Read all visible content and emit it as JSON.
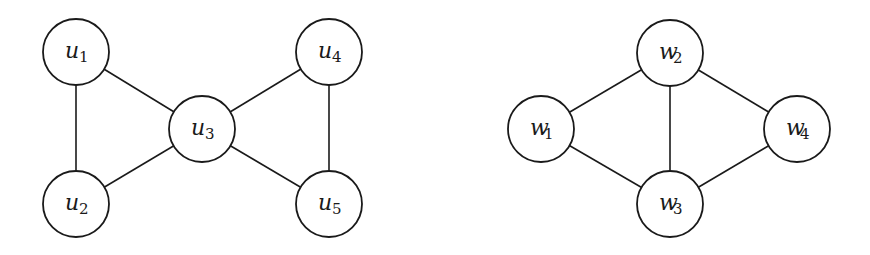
{
  "graphs": [
    {
      "name": "graph-u",
      "nodes": [
        {
          "id": "u1",
          "base": "u",
          "sub": "1",
          "x": 76,
          "y": 52
        },
        {
          "id": "u2",
          "base": "u",
          "sub": "2",
          "x": 76,
          "y": 204
        },
        {
          "id": "u3",
          "base": "u",
          "sub": "3",
          "x": 202,
          "y": 129
        },
        {
          "id": "u4",
          "base": "u",
          "sub": "4",
          "x": 329,
          "y": 52
        },
        {
          "id": "u5",
          "base": "u",
          "sub": "5",
          "x": 329,
          "y": 204
        }
      ],
      "edges": [
        [
          "u1",
          "u2"
        ],
        [
          "u1",
          "u3"
        ],
        [
          "u2",
          "u3"
        ],
        [
          "u3",
          "u4"
        ],
        [
          "u3",
          "u5"
        ],
        [
          "u4",
          "u5"
        ]
      ]
    },
    {
      "name": "graph-w",
      "nodes": [
        {
          "id": "w1",
          "base": "w",
          "sub": "1",
          "x": 541,
          "y": 129
        },
        {
          "id": "w2",
          "base": "w",
          "sub": "2",
          "x": 670,
          "y": 53
        },
        {
          "id": "w3",
          "base": "w",
          "sub": "3",
          "x": 670,
          "y": 204
        },
        {
          "id": "w4",
          "base": "w",
          "sub": "4",
          "x": 797,
          "y": 129
        }
      ],
      "edges": [
        [
          "w1",
          "w2"
        ],
        [
          "w1",
          "w3"
        ],
        [
          "w2",
          "w3"
        ],
        [
          "w2",
          "w4"
        ],
        [
          "w3",
          "w4"
        ]
      ]
    }
  ],
  "style": {
    "node_radius": 33,
    "stroke": "#1a1a1a",
    "fill": "#ffffff"
  }
}
